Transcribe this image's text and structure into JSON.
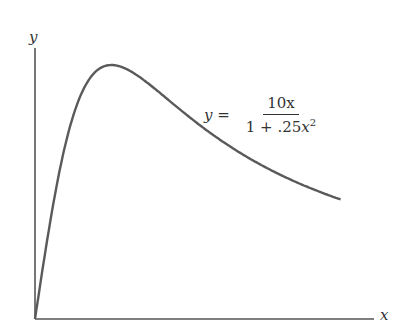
{
  "chart_data": {
    "type": "line",
    "title": "",
    "xlabel": "x",
    "ylabel": "y",
    "function": "y = 10x / (1 + .25x^2)",
    "annotation": {
      "lhs": "y =",
      "numerator": "10x",
      "denominator_prefix": "1 + .25",
      "denominator_var": "x",
      "denominator_exp": "2"
    },
    "xlim": [
      0,
      8.8
    ],
    "ylim": [
      0,
      11
    ],
    "grid": false,
    "ticks": false,
    "x": [
      0,
      0.5,
      1,
      1.5,
      2,
      2.5,
      3,
      4,
      5,
      6,
      7,
      8
    ],
    "values": [
      0,
      4.71,
      8.0,
      9.6,
      10.0,
      9.76,
      9.23,
      8.0,
      6.9,
      6.0,
      5.28,
      4.71
    ],
    "domain": [
      0,
      8
    ],
    "color": "#555555"
  },
  "labels": {
    "x_axis": "x",
    "y_axis": "y"
  }
}
